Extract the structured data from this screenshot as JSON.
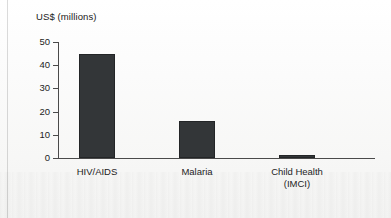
{
  "chart_data": {
    "type": "bar",
    "title": "",
    "subtitle": "",
    "xlabel": "",
    "ylabel": "US$ (millions)",
    "categories": [
      "HIV/AIDS",
      "Malaria",
      "Child Health\n(IMCI)"
    ],
    "values": [
      45,
      16,
      1
    ],
    "ylim": [
      0,
      50
    ],
    "yticks": [
      0,
      10,
      20,
      30,
      40,
      50
    ],
    "ytick_labels": [
      "0",
      "10",
      "20",
      "30",
      "40",
      "50"
    ],
    "grid": false,
    "legend": null,
    "series": [
      {
        "name": "US$ (millions)",
        "values": [
          45,
          16,
          1
        ],
        "color": "#333638"
      }
    ],
    "annotations": []
  },
  "axis": {
    "title": "US$ (millions)"
  },
  "colors": {
    "bar_fill": "#333638",
    "bar_stroke": "#232527",
    "axis_line": "#4a4a4a",
    "text": "#1d1d1d",
    "background": "#fdfdfd"
  }
}
